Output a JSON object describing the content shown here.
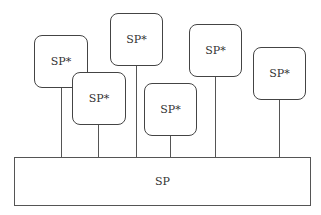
{
  "diagram": {
    "base": {
      "label": "SP"
    },
    "children": [
      {
        "label": "SP*"
      },
      {
        "label": "SP*"
      },
      {
        "label": "SP*"
      },
      {
        "label": "SP*"
      },
      {
        "label": "SP*"
      },
      {
        "label": "SP*"
      }
    ]
  }
}
